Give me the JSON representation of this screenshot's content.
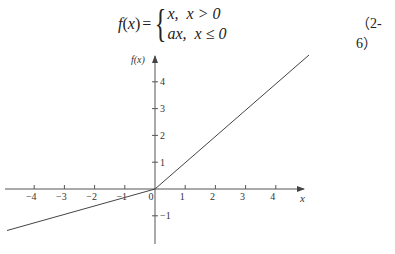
{
  "equation": {
    "lhs_func": "f",
    "lhs_open": "(",
    "lhs_var": "x",
    "lhs_close": ")",
    "equals": "=",
    "brace": "{",
    "case1_expr": "x,",
    "case1_cond": "x > 0",
    "case2_expr": "ax,",
    "case2_cond": "x ≤ 0",
    "number": "（2-6）"
  },
  "chart_data": {
    "type": "line",
    "title": "",
    "xlabel": "x",
    "ylabel": "f(x)",
    "xlim": [
      -5,
      5
    ],
    "ylim": [
      -2,
      5
    ],
    "grid": false,
    "x_ticks": [
      -4,
      -3,
      -2,
      -1,
      0,
      1,
      2,
      3,
      4
    ],
    "y_ticks": [
      -1,
      1,
      2,
      3,
      4
    ],
    "x_tick_labels": [
      "−4",
      "−3",
      "−2",
      "−1",
      "0",
      "1",
      "2",
      "3",
      "4"
    ],
    "y_tick_labels": [
      "−1",
      "1",
      "2",
      "3",
      "4"
    ],
    "series": [
      {
        "name": "f(x) = ax (x ≤ 0), a ≈ 0.3",
        "x": [
          -4.9,
          0
        ],
        "y": [
          -1.55,
          0
        ]
      },
      {
        "name": "f(x) = x (x > 0)",
        "x": [
          0,
          5.1
        ],
        "y": [
          0,
          5.0
        ]
      }
    ],
    "annotations": []
  }
}
